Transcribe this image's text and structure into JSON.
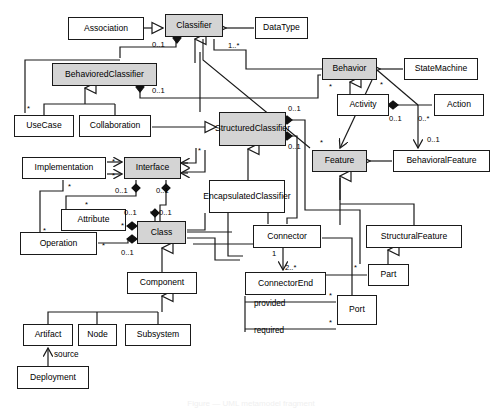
{
  "diagram": {
    "kind": "uml-class-diagram",
    "colors": {
      "line": "#1a1a1a",
      "box_fill": "#ffffff",
      "highlight_fill": "#d4d4d4",
      "text": "#000000"
    },
    "classes": [
      {
        "id": "association",
        "label": "Association",
        "x": 68,
        "y": 17,
        "w": 76,
        "h": 23,
        "shaded": false
      },
      {
        "id": "classifier",
        "label": "Classifier",
        "x": 165,
        "y": 14,
        "w": 58,
        "h": 23,
        "shaded": true
      },
      {
        "id": "datatype",
        "label": "DataType",
        "x": 255,
        "y": 17,
        "w": 53,
        "h": 22,
        "shaded": false
      },
      {
        "id": "behavioredclassifier",
        "label": "BehavioredClassifier",
        "x": 52,
        "y": 63,
        "w": 105,
        "h": 23,
        "shaded": true
      },
      {
        "id": "behavior",
        "label": "Behavior",
        "x": 322,
        "y": 58,
        "w": 55,
        "h": 22,
        "shaded": true
      },
      {
        "id": "statemachine",
        "label": "StateMachine",
        "x": 404,
        "y": 58,
        "w": 74,
        "h": 22,
        "shaded": false
      },
      {
        "id": "usecase",
        "label": "UseCase",
        "x": 14,
        "y": 115,
        "w": 60,
        "h": 22,
        "shaded": false
      },
      {
        "id": "collaboration",
        "label": "Collaboration",
        "x": 79,
        "y": 115,
        "w": 72,
        "h": 22,
        "shaded": false
      },
      {
        "id": "structuredclassifier",
        "label": "Structured\nClassifier",
        "x": 219,
        "y": 112,
        "w": 67,
        "h": 34,
        "shaded": true
      },
      {
        "id": "activity",
        "label": "Activity",
        "x": 337,
        "y": 94,
        "w": 52,
        "h": 22,
        "shaded": false
      },
      {
        "id": "action",
        "label": "Action",
        "x": 434,
        "y": 94,
        "w": 50,
        "h": 22,
        "shaded": false
      },
      {
        "id": "feature",
        "label": "Feature",
        "x": 312,
        "y": 150,
        "w": 55,
        "h": 22,
        "shaded": true
      },
      {
        "id": "behavioralfeature",
        "label": "BehavioralFeature",
        "x": 393,
        "y": 150,
        "w": 97,
        "h": 22,
        "shaded": false
      },
      {
        "id": "implementation",
        "label": "Implementation",
        "x": 22,
        "y": 157,
        "w": 84,
        "h": 22,
        "shaded": false
      },
      {
        "id": "interface",
        "label": "Interface",
        "x": 124,
        "y": 157,
        "w": 57,
        "h": 22,
        "shaded": true
      },
      {
        "id": "encapsulatedclassifier",
        "label": "Encapsulated\nClassifier",
        "x": 209,
        "y": 180,
        "w": 76,
        "h": 33,
        "shaded": false
      },
      {
        "id": "attribute",
        "label": "Attribute",
        "x": 61,
        "y": 209,
        "w": 65,
        "h": 22,
        "shaded": false
      },
      {
        "id": "class",
        "label": "Class",
        "x": 137,
        "y": 221,
        "w": 49,
        "h": 23,
        "shaded": true
      },
      {
        "id": "operation",
        "label": "Operation",
        "x": 20,
        "y": 232,
        "w": 77,
        "h": 23,
        "shaded": false
      },
      {
        "id": "connector",
        "label": "Connector",
        "x": 253,
        "y": 225,
        "w": 68,
        "h": 23,
        "shaded": false
      },
      {
        "id": "structuralfeature",
        "label": "StructuralFeature",
        "x": 366,
        "y": 225,
        "w": 96,
        "h": 23,
        "shaded": false
      },
      {
        "id": "part",
        "label": "Part",
        "x": 368,
        "y": 264,
        "w": 41,
        "h": 22,
        "shaded": false
      },
      {
        "id": "component",
        "label": "Component",
        "x": 127,
        "y": 272,
        "w": 70,
        "h": 22,
        "shaded": false
      },
      {
        "id": "connectorend",
        "label": "ConnectorEnd",
        "x": 245,
        "y": 272,
        "w": 81,
        "h": 23,
        "shaded": false
      },
      {
        "id": "port",
        "label": "Port",
        "x": 337,
        "y": 295,
        "w": 40,
        "h": 30,
        "shaded": false
      },
      {
        "id": "artifact",
        "label": "Artifact",
        "x": 23,
        "y": 324,
        "w": 50,
        "h": 22,
        "shaded": false
      },
      {
        "id": "node",
        "label": "Node",
        "x": 78,
        "y": 324,
        "w": 39,
        "h": 22,
        "shaded": false
      },
      {
        "id": "subsystem",
        "label": "Subsystem",
        "x": 125,
        "y": 324,
        "w": 66,
        "h": 22,
        "shaded": false
      },
      {
        "id": "deployment",
        "label": "Deployment",
        "x": 17,
        "y": 366,
        "w": 72,
        "h": 23,
        "shaded": false
      }
    ],
    "multiplicities": [
      {
        "id": "m-assoc-classifier",
        "text": "0..1",
        "x": 152,
        "y": 40
      },
      {
        "id": "m-classifier-dt",
        "text": "1..*",
        "x": 228,
        "y": 41
      },
      {
        "id": "m-behcls-struct",
        "text": "0..1",
        "x": 152,
        "y": 86
      },
      {
        "id": "m-struct-top",
        "text": "0..1",
        "x": 288,
        "y": 104
      },
      {
        "id": "m-struct-bottom",
        "text": "0..1",
        "x": 288,
        "y": 142
      },
      {
        "id": "m-behavior-star",
        "text": "*",
        "x": 329,
        "y": 82
      },
      {
        "id": "m-statemachine-star",
        "text": "*",
        "x": 380,
        "y": 80
      },
      {
        "id": "m-activity-action",
        "text": "0..1",
        "x": 389,
        "y": 114
      },
      {
        "id": "m-action-mult",
        "text": "0..*",
        "x": 418,
        "y": 114
      },
      {
        "id": "m-behfeat",
        "text": "0..1",
        "x": 427,
        "y": 135
      },
      {
        "id": "m-feature-star",
        "text": "*",
        "x": 320,
        "y": 138
      },
      {
        "id": "m-usecase-star",
        "text": "*",
        "x": 27,
        "y": 104
      },
      {
        "id": "m-impl-star1",
        "text": "*",
        "x": 112,
        "y": 157
      },
      {
        "id": "m-impl-star2",
        "text": "*",
        "x": 112,
        "y": 171
      },
      {
        "id": "m-interface-star",
        "text": "*",
        "x": 198,
        "y": 146
      },
      {
        "id": "m-iface-left",
        "text": "0..1",
        "x": 115,
        "y": 186
      },
      {
        "id": "m-iface-right",
        "text": "0..1",
        "x": 156,
        "y": 186
      },
      {
        "id": "m-impl-down-star",
        "text": "*",
        "x": 68,
        "y": 182
      },
      {
        "id": "m-attr-up-star",
        "text": "*",
        "x": 85,
        "y": 200
      },
      {
        "id": "m-class-left",
        "text": "0..1",
        "x": 124,
        "y": 208
      },
      {
        "id": "m-class-right",
        "text": "0..1",
        "x": 159,
        "y": 208
      },
      {
        "id": "m-attr-star",
        "text": "*",
        "x": 121,
        "y": 221
      },
      {
        "id": "m-oper-star1",
        "text": "*",
        "x": 43,
        "y": 226
      },
      {
        "id": "m-oper-star2",
        "text": "*",
        "x": 102,
        "y": 241
      },
      {
        "id": "m-class-bottom",
        "text": "0..1",
        "x": 121,
        "y": 248
      },
      {
        "id": "m-connector-1",
        "text": "1",
        "x": 272,
        "y": 249
      },
      {
        "id": "m-connectorend-2",
        "text": "2..*",
        "x": 285,
        "y": 263
      },
      {
        "id": "m-part-star",
        "text": "*",
        "x": 354,
        "y": 263
      },
      {
        "id": "m-port-provided",
        "text": "*",
        "x": 329,
        "y": 291
      },
      {
        "id": "m-port-required",
        "text": "*",
        "x": 329,
        "y": 318
      }
    ],
    "edge_labels": [
      {
        "id": "lbl-provided",
        "text": "provided",
        "x": 254,
        "y": 299
      },
      {
        "id": "lbl-required",
        "text": "required",
        "x": 254,
        "y": 326
      },
      {
        "id": "lbl-source",
        "text": "source",
        "x": 54,
        "y": 350
      }
    ],
    "caption": "Figure — UML metamodel fragment"
  }
}
